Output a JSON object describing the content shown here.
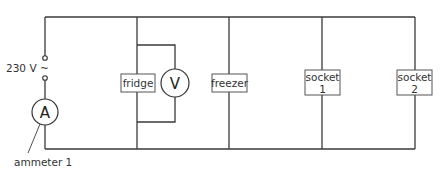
{
  "diagram": {
    "type": "parallel circuit",
    "supply": {
      "label": "230 V ~",
      "symbol": "ac-supply"
    },
    "ammeter": {
      "symbol": "A",
      "label": "ammeter 1"
    },
    "voltmeter": {
      "symbol": "V",
      "connected_across": "fridge"
    },
    "branches": [
      {
        "name": "fridge",
        "line1": "fridge",
        "line2": ""
      },
      {
        "name": "freezer",
        "line1": "freezer",
        "line2": ""
      },
      {
        "name": "socket 1",
        "line1": "socket",
        "line2": "1"
      },
      {
        "name": "socket 2",
        "line1": "socket",
        "line2": "2"
      }
    ],
    "colors": {
      "wire": "#3a3a3a",
      "box_border": "#555555",
      "text": "#333333"
    }
  }
}
